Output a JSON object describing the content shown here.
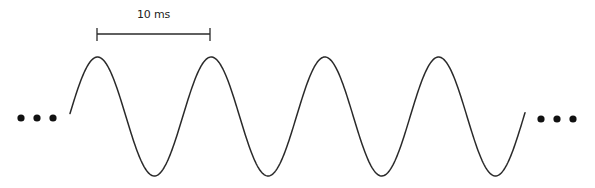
{
  "diagram": {
    "colors": {
      "stroke": "#2a2a2a",
      "dots": "#111111",
      "background": "#ffffff"
    },
    "scale_bar": {
      "label": "10 ms",
      "x_start": 97,
      "x_end": 210,
      "y": 34,
      "tick_half_height": 6
    },
    "wave": {
      "x_start": 70,
      "x_end": 525,
      "period_px": 113.7,
      "first_peak_x": 97.5,
      "peak_y": 57,
      "trough_y": 176,
      "cycles_visible": 4,
      "peaks_x": [
        98,
        210,
        325,
        440
      ],
      "troughs_x": [
        154,
        268,
        384,
        497
      ]
    },
    "continuation_left": {
      "symbol": "...",
      "dots_x": [
        21,
        37,
        53
      ],
      "y": 118,
      "r": 3.6
    },
    "continuation_right": {
      "symbol": "...",
      "dots_x": [
        541,
        557,
        573
      ],
      "y": 119,
      "r": 3.6
    }
  }
}
